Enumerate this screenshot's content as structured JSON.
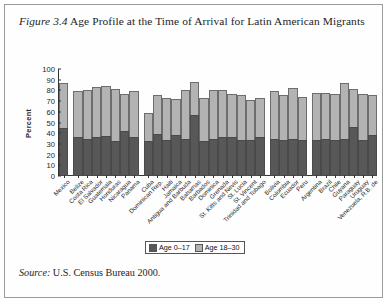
{
  "figure": {
    "number_label": "Figure 3.4",
    "caption": " Age Profile at the Time of Arrival for Latin American Migrants",
    "source_label": "Source:",
    "source_text": " U.S. Census Bureau 2000."
  },
  "legend": {
    "position": "bottom-center",
    "items": [
      {
        "label": "Age 0–17",
        "color": "#585858"
      },
      {
        "label": "Age 18–30",
        "color": "#b3b3b3"
      }
    ]
  },
  "colors": {
    "series_age_0_17": "#585858",
    "series_age_18_30": "#b3b3b3",
    "axis": "#333333",
    "frame_border": "#9a9a9a",
    "text": "#1d1d1d"
  },
  "chart_data": {
    "type": "bar",
    "stacked": true,
    "title": "Age Profile at the Time of Arrival for Latin American Migrants",
    "xlabel": "",
    "ylabel": "Percent",
    "ylim": [
      0,
      100
    ],
    "yticks": [
      0,
      10,
      20,
      30,
      40,
      50,
      60,
      70,
      80,
      90,
      100
    ],
    "grid": false,
    "legend": [
      "Age 0–17",
      "Age 18–30"
    ],
    "categories": [
      "Mexico",
      "Belize",
      "Costa Rica",
      "El Salvador",
      "Guatemala",
      "Honduras",
      "Nicaragua",
      "Panama",
      "Cuba",
      "Dominican Rep.",
      "Haiti",
      "Jamaica",
      "Antigua and Barbuda",
      "Bahamas",
      "Barbados",
      "Dominica",
      "Grenada",
      "St. Kitts and Nevis",
      "St. Lucia",
      "St. Vincent",
      "Trinidad and Tobago",
      "Bolivia",
      "Colombia",
      "Ecuador",
      "Peru",
      "Argentina",
      "Brazil",
      "Chile",
      "Guyana",
      "Paraguay",
      "Uruguay",
      "Venezuela, R.B. de"
    ],
    "group_breaks_after": [
      "Mexico",
      "Panama",
      "Trinidad and Tobago",
      "Peru"
    ],
    "series": [
      {
        "name": "Age 0–17",
        "values": [
          45,
          36,
          35,
          36,
          37,
          33,
          42,
          36,
          33,
          39,
          34,
          38,
          35,
          57,
          33,
          35,
          36,
          36,
          34,
          34,
          36,
          35,
          34,
          35,
          34,
          34,
          35,
          34,
          35,
          46,
          34,
          38
        ]
      },
      {
        "name": "Age 18–30",
        "values": [
          42,
          43,
          45,
          47,
          47,
          48,
          35,
          43,
          26,
          37,
          39,
          34,
          45,
          31,
          40,
          45,
          44,
          41,
          42,
          37,
          37,
          44,
          42,
          47,
          40,
          44,
          43,
          43,
          52,
          35,
          43,
          38
        ]
      }
    ],
    "totals": [
      87,
      79,
      80,
      83,
      84,
      81,
      77,
      79,
      59,
      76,
      73,
      72,
      80,
      88,
      73,
      80,
      80,
      77,
      76,
      71,
      73,
      79,
      76,
      82,
      74,
      78,
      78,
      77,
      87,
      81,
      77,
      76
    ]
  }
}
